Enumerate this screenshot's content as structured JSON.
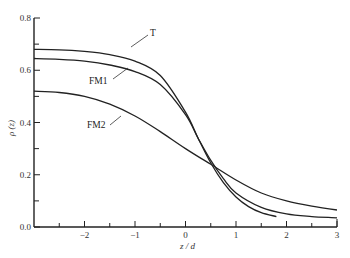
{
  "chart_data": {
    "type": "line",
    "title": "",
    "xlabel": "z / d",
    "ylabel": "ρ (z)",
    "xlim": [
      -3,
      3
    ],
    "ylim": [
      0,
      0.8
    ],
    "grid": false,
    "legend": "inline labels with leader lines",
    "x_ticks": [
      -2,
      -1,
      0,
      1,
      2,
      3
    ],
    "x_tick_labels": [
      "−2",
      "−1",
      "0",
      "1",
      "2",
      "3"
    ],
    "x_minor_ticks": [
      -2.5,
      -1.5,
      -0.5,
      0.5,
      1.5,
      2.5
    ],
    "y_ticks": [
      0.0,
      0.2,
      0.4,
      0.6,
      0.8
    ],
    "y_tick_labels": [
      "0.0",
      "0.2",
      "0.4",
      "0.6",
      "0.8"
    ],
    "y_minor_ticks": [
      0.1,
      0.3,
      0.5,
      0.7
    ],
    "series": [
      {
        "name": "T",
        "x": [
          -3,
          -2.5,
          -2,
          -1.5,
          -1,
          -0.5,
          0,
          0.25,
          0.5,
          0.75,
          1,
          1.25,
          1.5,
          1.8
        ],
        "values": [
          0.68,
          0.678,
          0.672,
          0.66,
          0.635,
          0.58,
          0.44,
          0.34,
          0.245,
          0.17,
          0.115,
          0.078,
          0.055,
          0.04
        ]
      },
      {
        "name": "FM1",
        "x": [
          -3,
          -2.5,
          -2,
          -1.5,
          -1,
          -0.5,
          0,
          0.25,
          0.5,
          0.75,
          1,
          1.5,
          2,
          2.5,
          3
        ],
        "values": [
          0.645,
          0.642,
          0.635,
          0.62,
          0.595,
          0.545,
          0.43,
          0.34,
          0.255,
          0.185,
          0.13,
          0.075,
          0.05,
          0.04,
          0.035
        ]
      },
      {
        "name": "FM2",
        "x": [
          -3,
          -2.5,
          -2,
          -1.5,
          -1,
          -0.5,
          0,
          0.5,
          1,
          1.5,
          2,
          2.5,
          3
        ],
        "values": [
          0.52,
          0.515,
          0.5,
          0.47,
          0.425,
          0.365,
          0.3,
          0.24,
          0.18,
          0.13,
          0.1,
          0.08,
          0.065
        ]
      }
    ],
    "annotations": [
      {
        "text": "T",
        "points_to": "T",
        "near_x": -0.6
      },
      {
        "text": "FM1",
        "points_to": "FM1",
        "near_x": -0.9
      },
      {
        "text": "FM2",
        "points_to": "FM2",
        "near_x": -0.9
      }
    ]
  },
  "labels": {
    "T": "T",
    "FM1": "FM1",
    "FM2": "FM2",
    "xlabel": "z / d",
    "ylabel": "ρ (z)"
  }
}
